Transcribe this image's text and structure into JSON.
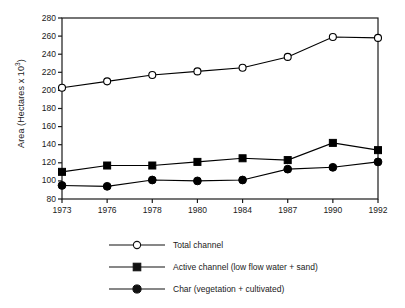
{
  "chart_data": {
    "type": "line",
    "title": "",
    "xlabel": "",
    "ylabel": "Area (Hectares x 10",
    "ylabel_exponent": "3",
    "ylabel_close": ")",
    "categories": [
      "1973",
      "1976",
      "1978",
      "1980",
      "1984",
      "1987",
      "1990",
      "1992"
    ],
    "x": [
      1973,
      1976,
      1978,
      1980,
      1984,
      1987,
      1990,
      1992
    ],
    "xlim": [
      1973,
      1992
    ],
    "ylim": [
      80,
      280
    ],
    "yticks": [
      280,
      260,
      240,
      220,
      200,
      180,
      160,
      140,
      120,
      100,
      80
    ],
    "ytick_labels": [
      "280",
      "260",
      "240",
      "220",
      "200",
      "180",
      "160",
      "140",
      "120",
      "100",
      "80"
    ],
    "grid": false,
    "legend_position": "below",
    "series": [
      {
        "name": "Total channel",
        "marker": "open-circle",
        "color": "#000000",
        "values": [
          203,
          210,
          217,
          221,
          225,
          237,
          259,
          258
        ]
      },
      {
        "name": "Active channel (low flow water + sand)",
        "marker": "filled-square",
        "color": "#000000",
        "values": [
          110,
          117,
          117,
          121,
          125,
          123,
          142,
          134
        ]
      },
      {
        "name": "Char (vegetation + cultivated)",
        "marker": "filled-circle",
        "color": "#000000",
        "values": [
          95,
          94,
          101,
          100,
          101,
          113,
          115,
          121
        ]
      }
    ]
  },
  "legend": {
    "items": [
      {
        "label": "Total channel",
        "marker": "open-circle"
      },
      {
        "label": "Active channel (low flow water + sand)",
        "marker": "filled-square"
      },
      {
        "label": "Char (vegetation + cultivated)",
        "marker": "filled-circle"
      }
    ]
  },
  "style": {
    "axis_color": "#1a1a1a",
    "plot_background": "#ffffff",
    "series_color": "#000000"
  }
}
